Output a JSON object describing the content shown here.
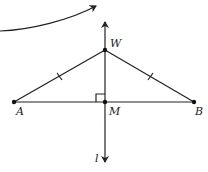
{
  "diagram": {
    "type": "geometry",
    "points": {
      "A": {
        "label": "A",
        "x": 14,
        "y": 102
      },
      "B": {
        "label": "B",
        "x": 194,
        "y": 102
      },
      "M": {
        "label": "M",
        "x": 105,
        "y": 102
      },
      "W": {
        "label": "W",
        "x": 105,
        "y": 50
      }
    },
    "line": {
      "label": "l"
    },
    "segments": [
      "AB",
      "AW",
      "WB"
    ],
    "congruence_marks": [
      "AW",
      "WB"
    ],
    "right_angle_at": "M",
    "colors": {
      "stroke": "#222222",
      "background": "#ffffff"
    }
  }
}
